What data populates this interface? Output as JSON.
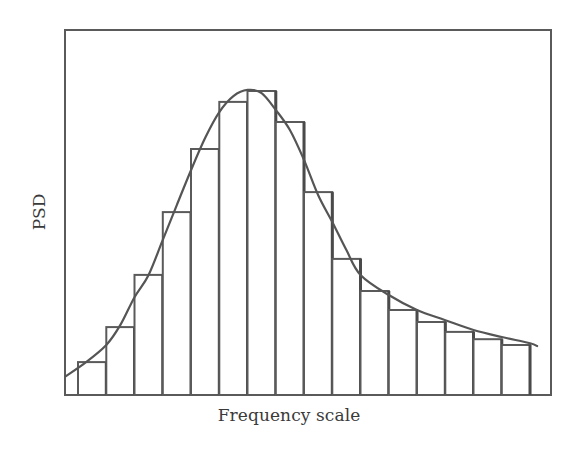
{
  "chart_data": {
    "type": "bar",
    "title": "",
    "xlabel": "Frequency scale",
    "ylabel": "PSD",
    "grid": false,
    "legend": null,
    "x_ticks": [],
    "y_ticks": [],
    "ylim": [
      0,
      100
    ],
    "categories": [
      "1",
      "2",
      "3",
      "4",
      "5",
      "6",
      "7",
      "8",
      "9",
      "10",
      "11",
      "12",
      "13",
      "14",
      "15",
      "16"
    ],
    "series": [
      {
        "name": "PSD histogram",
        "type": "bar",
        "values": [
          9.0,
          18.6,
          32.9,
          50.1,
          67.4,
          80.3,
          83.3,
          74.8,
          55.6,
          37.3,
          28.5,
          23.3,
          20.0,
          17.3,
          15.3,
          13.7
        ]
      },
      {
        "name": "PSD fitted curve",
        "type": "line",
        "x": [
          0.0,
          0.5,
          1.0,
          1.5,
          2.0,
          2.5,
          3.0,
          3.5,
          4.0,
          4.5,
          5.0,
          5.5,
          6.0,
          6.5,
          7.0,
          7.5,
          8.0,
          8.5,
          9.0,
          9.5,
          10.0,
          11.0,
          12.0,
          13.0,
          14.0,
          15.0,
          16.0,
          16.25
        ],
        "values": [
          5.2,
          9.0,
          13.7,
          19.2,
          26.8,
          32.9,
          42.5,
          52.1,
          61.6,
          70.4,
          77.5,
          81.9,
          83.6,
          82.7,
          78.1,
          72.6,
          64.4,
          54.8,
          47.4,
          39.7,
          32.9,
          27.4,
          23.3,
          20.5,
          17.8,
          15.9,
          14.2,
          13.4
        ]
      }
    ],
    "colors": {
      "lines": "#5a5a5a",
      "bar_fill": "#ffffff",
      "background": "#ffffff",
      "text": "#3a3a3a"
    }
  },
  "labels": {
    "x_axis": "Frequency scale",
    "y_axis": "PSD"
  }
}
